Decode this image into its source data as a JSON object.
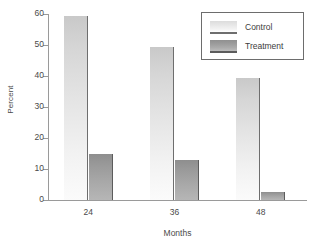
{
  "chart_data": {
    "type": "bar",
    "title": "",
    "subtitle": "",
    "xlabel": "Months",
    "ylabel": "Percent",
    "categories": [
      "24",
      "36",
      "48"
    ],
    "series": [
      {
        "name": "Control",
        "values": [
          59.5,
          49.5,
          39.5
        ],
        "color": "#e0e0e0"
      },
      {
        "name": "Treatment",
        "values": [
          15.0,
          13.0,
          2.5
        ],
        "color": "#9c9c9c"
      }
    ],
    "ylim": [
      0,
      60
    ],
    "y_ticks": [
      0,
      10,
      20,
      30,
      40,
      50,
      60
    ],
    "y_tick_labels": [
      "0",
      "10",
      "20",
      "30",
      "40",
      "50",
      "60"
    ],
    "x_tick_labels": [
      "24",
      "36",
      "48"
    ],
    "grid": false,
    "legend": {
      "position": "top-right",
      "entries": [
        {
          "label": "Control",
          "swatch": "control-swatch"
        },
        {
          "label": "Treatment",
          "swatch": "treatment-swatch"
        }
      ]
    },
    "axis_color": "#9a9a9a",
    "background": "#ffffff"
  }
}
